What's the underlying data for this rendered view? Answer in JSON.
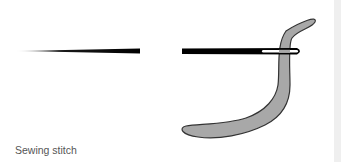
{
  "caption": "Sewing stitch",
  "colors": {
    "needle": "#000000",
    "thread_fill": "#a8a8a8",
    "thread_stroke": "#333333",
    "background": "#ffffff",
    "side_strip": "#efefef",
    "caption": "#555555"
  },
  "elements": {
    "left_needle": "tapered needle shaft",
    "right_needle": "needle with eye",
    "thread": "thread passing through needle eye"
  }
}
